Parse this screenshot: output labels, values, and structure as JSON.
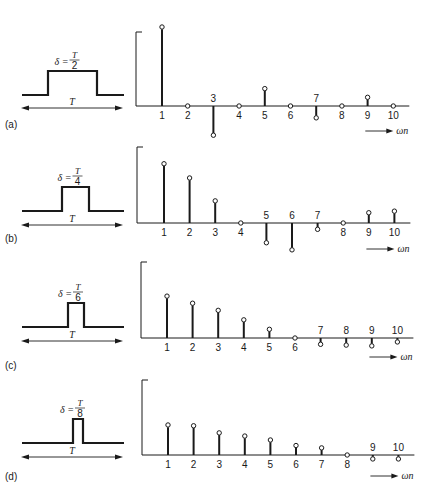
{
  "figure": {
    "panels": [
      {
        "id": "a",
        "label": "(a)",
        "delta_label": "δ =",
        "frac_num": "T",
        "frac_den": "2",
        "period_label": "T"
      },
      {
        "id": "b",
        "label": "(b)",
        "delta_label": "δ =",
        "frac_num": "T",
        "frac_den": "4",
        "period_label": "T"
      },
      {
        "id": "c",
        "label": "(c)",
        "delta_label": "δ =",
        "frac_num": "T",
        "frac_den": "6",
        "period_label": "T"
      },
      {
        "id": "d",
        "label": "(d)",
        "delta_label": "δ =",
        "frac_num": "T",
        "frac_den": "8",
        "period_label": "T"
      }
    ],
    "x_axis_label": "ωn",
    "colors": {
      "ink": "#1a1a1a",
      "background": "#ffffff"
    }
  },
  "chart_data": [
    {
      "type": "stem",
      "title": "(a) δ = T/2",
      "xlabel": "ωn",
      "ylabel": "",
      "categories": [
        1,
        2,
        3,
        4,
        5,
        6,
        7,
        8,
        9,
        10
      ],
      "values": [
        1.0,
        0.0,
        -0.37,
        0.0,
        0.22,
        0.0,
        -0.15,
        0.0,
        0.11,
        0.0
      ],
      "grid": false
    },
    {
      "type": "stem",
      "title": "(b) δ = T/4",
      "xlabel": "ωn",
      "ylabel": "",
      "categories": [
        1,
        2,
        3,
        4,
        5,
        6,
        7,
        8,
        9,
        10
      ],
      "values": [
        0.75,
        0.57,
        0.28,
        0.0,
        -0.25,
        -0.34,
        -0.08,
        0.0,
        0.13,
        0.15
      ],
      "grid": false
    },
    {
      "type": "stem",
      "title": "(c) δ = T/6",
      "xlabel": "ωn",
      "ylabel": "",
      "categories": [
        1,
        2,
        3,
        4,
        5,
        6,
        7,
        8,
        9,
        10
      ],
      "values": [
        0.53,
        0.44,
        0.35,
        0.23,
        0.11,
        0.0,
        -0.08,
        -0.09,
        -0.1,
        -0.05
      ],
      "grid": false
    },
    {
      "type": "stem",
      "title": "(d) δ = T/8",
      "xlabel": "ωn",
      "ylabel": "",
      "categories": [
        1,
        2,
        3,
        4,
        5,
        6,
        7,
        8,
        9,
        10
      ],
      "values": [
        0.38,
        0.37,
        0.28,
        0.24,
        0.19,
        0.12,
        0.09,
        0.0,
        -0.05,
        -0.05
      ],
      "grid": false
    }
  ]
}
